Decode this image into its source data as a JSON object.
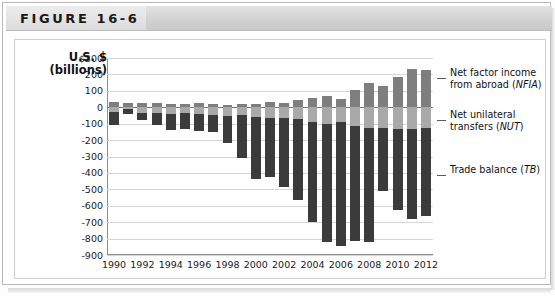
{
  "header": {
    "figure_label": "FIGURE 16-6"
  },
  "axis": {
    "title_line1": "U.S. $",
    "title_line2": "(billions)"
  },
  "legend": [
    {
      "key": "nfia",
      "line1": "Net factor income",
      "line2": "from abroad (",
      "abbr": "NFIA",
      "tail": ")",
      "color": "#7e7e7e"
    },
    {
      "key": "nut",
      "line1": "Net unilateral",
      "line2": "transfers (",
      "abbr": "NUT",
      "tail": ")",
      "color": "#a9a9a9"
    },
    {
      "key": "tb",
      "line1": "Trade balance (",
      "line2": "",
      "abbr": "TB",
      "tail": ")",
      "color": "#3b3b3b"
    }
  ],
  "colors": {
    "nfia": "#7e7e7e",
    "nut": "#a9a9a9",
    "tb": "#3b3b3b",
    "grid": "#d5d5d5",
    "axis": "#8e8e8e"
  },
  "chart_data": {
    "type": "bar",
    "stacked": true,
    "title": "FIGURE 16-6",
    "xlabel": "",
    "ylabel": "U.S. $ (billions)",
    "ylim": [
      -900,
      300
    ],
    "ytick_step": 100,
    "yticks": [
      "$300",
      "200",
      "100",
      "0",
      "-100",
      "-200",
      "-300",
      "-400",
      "-500",
      "-600",
      "-700",
      "-800",
      "-900"
    ],
    "grid": true,
    "legend_position": "right",
    "categories": [
      1990,
      1991,
      1992,
      1993,
      1994,
      1995,
      1996,
      1997,
      1998,
      1999,
      2000,
      2001,
      2002,
      2003,
      2004,
      2005,
      2006,
      2007,
      2008,
      2009,
      2010,
      2011,
      2012
    ],
    "xtick_labels": [
      "1990",
      "1992",
      "1994",
      "1996",
      "1998",
      "2000",
      "2002",
      "2004",
      "2006",
      "2008",
      "2010",
      "2012"
    ],
    "series": [
      {
        "name": "Net factor income from abroad (NFIA)",
        "abbr": "NFIA",
        "color": "#7e7e7e",
        "values": [
          29,
          25,
          26,
          27,
          19,
          22,
          25,
          20,
          13,
          18,
          21,
          30,
          28,
          45,
          58,
          71,
          50,
          105,
          150,
          130,
          185,
          230,
          225
        ]
      },
      {
        "name": "Net unilateral transfers (NUT)",
        "abbr": "NUT",
        "color": "#a9a9a9",
        "values": [
          -27,
          -10,
          -36,
          -38,
          -40,
          -36,
          -43,
          -45,
          -53,
          -49,
          -58,
          -64,
          -65,
          -71,
          -88,
          -105,
          -92,
          -115,
          -125,
          -125,
          -133,
          -133,
          -128
        ]
      },
      {
        "name": "Trade balance (TB)",
        "abbr": "TB",
        "color": "#3b3b3b",
        "values": [
          -80,
          -31,
          -39,
          -70,
          -98,
          -96,
          -104,
          -108,
          -166,
          -259,
          -377,
          -362,
          -418,
          -494,
          -610,
          -714,
          -754,
          -700,
          -698,
          -384,
          -494,
          -548,
          -535
        ]
      }
    ]
  }
}
